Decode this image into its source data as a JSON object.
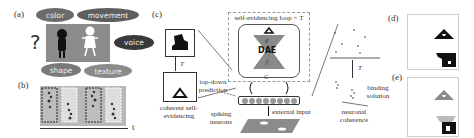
{
  "panels": {
    "a": {
      "label": "(a)",
      "features": [
        "color",
        "movement",
        "voice",
        "shape",
        "texture"
      ],
      "question_mark": "?"
    },
    "b": {
      "label": "(b)",
      "axis_label": "t"
    },
    "c": {
      "label": "(c)",
      "loop_title": "self-evidencing loop × T",
      "dae_label": "DAE",
      "encoder_symbol": "g",
      "decoder_symbol": "f",
      "feedback_symbol": "G",
      "T_label_left": "T",
      "T_label_right": "T",
      "top_down_prediction": "top-down prediction",
      "coherent_self_evidencing": "coherent self-evidencing",
      "spiking_neurons": "spiking neurons",
      "external_input": "external input",
      "binding_solution": "binding solution",
      "neuronal_coherence": "neuronal coherence",
      "neuron_count": 8
    },
    "d": {
      "label": "(d)"
    },
    "e": {
      "label": "(e)"
    }
  },
  "colors": {
    "pill_color": "#6b6b6b",
    "pill_movement": "#5e5e5e",
    "pill_voice": "#3a3a3a",
    "pill_shape": "#7a7a7a",
    "pill_texture": "#8a8a8a",
    "scene_bg": "#8c8c8c",
    "hourglass": "#8a8a8a",
    "neuron": "#999999"
  }
}
